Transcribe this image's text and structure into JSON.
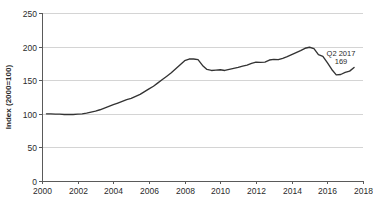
{
  "chart_data": {
    "type": "line",
    "title": "",
    "subtitle": "",
    "xlabel": "",
    "ylabel": "Index (2000=100)",
    "xlim": [
      2000,
      2018
    ],
    "ylim": [
      0,
      250
    ],
    "grid": "horizontal",
    "legend": "none",
    "x_ticks": [
      "2000",
      "2002",
      "2004",
      "2006",
      "2008",
      "2010",
      "2012",
      "2014",
      "2016",
      "2018"
    ],
    "x_tick_values": [
      2000,
      2002,
      2004,
      2006,
      2008,
      2010,
      2012,
      2014,
      2016,
      2018
    ],
    "y_ticks": [
      "0",
      "50",
      "100",
      "150",
      "200",
      "250"
    ],
    "y_tick_values": [
      0,
      50,
      100,
      150,
      200,
      250
    ],
    "series": [
      {
        "name": "Index",
        "color": "#333333",
        "x": [
          2000.25,
          2000.5,
          2000.75,
          2001.0,
          2001.25,
          2001.5,
          2001.75,
          2002.0,
          2002.25,
          2002.5,
          2002.75,
          2003.0,
          2003.25,
          2003.5,
          2003.75,
          2004.0,
          2004.25,
          2004.5,
          2004.75,
          2005.0,
          2005.25,
          2005.5,
          2005.75,
          2006.0,
          2006.25,
          2006.5,
          2006.75,
          2007.0,
          2007.25,
          2007.5,
          2007.75,
          2008.0,
          2008.25,
          2008.5,
          2008.75,
          2009.0,
          2009.25,
          2009.5,
          2009.75,
          2010.0,
          2010.25,
          2010.5,
          2010.75,
          2011.0,
          2011.25,
          2011.5,
          2011.75,
          2012.0,
          2012.25,
          2012.5,
          2012.75,
          2013.0,
          2013.25,
          2013.5,
          2013.75,
          2014.0,
          2014.25,
          2014.5,
          2014.75,
          2015.0,
          2015.25,
          2015.5,
          2015.75,
          2016.0,
          2016.25,
          2016.5,
          2016.75,
          2017.0,
          2017.25,
          2017.5
        ],
        "values": [
          100,
          100,
          99.5,
          99.5,
          99,
          99,
          99,
          99.5,
          100,
          101,
          102.5,
          104,
          106,
          108.5,
          111,
          113.5,
          116,
          118.5,
          121,
          123,
          126,
          129,
          133,
          137,
          141,
          146,
          151,
          156,
          161,
          167,
          173,
          179,
          181.5,
          181.5,
          180.5,
          172,
          166,
          164.5,
          165,
          165.5,
          164.5,
          166,
          167.5,
          169,
          171,
          172.5,
          175,
          177,
          176.5,
          177,
          180,
          181,
          180.5,
          182.5,
          185,
          188,
          191,
          194,
          197.5,
          199,
          197,
          188,
          185.5,
          176,
          166,
          158,
          158.5,
          161.5,
          163.5,
          169
        ]
      }
    ],
    "annotations": [
      {
        "name": "endpoint-callout",
        "label_line1": "Q2 2017",
        "label_line2": "169",
        "x": 2017.5,
        "y": 169
      }
    ]
  },
  "geometry": {
    "plot_left": 42,
    "plot_right": 363,
    "plot_top": 13,
    "plot_bottom": 181
  }
}
